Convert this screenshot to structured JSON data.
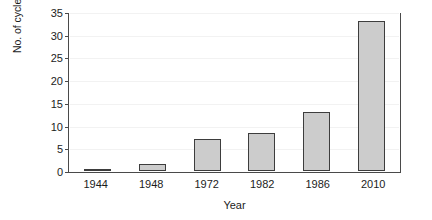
{
  "chart_data": {
    "type": "bar",
    "title": "",
    "subtitle": "",
    "xlabel": "Year",
    "ylabel": "No. of cycle-rickshaws per 1,000 residents",
    "categories": [
      "1944",
      "1948",
      "1972",
      "1982",
      "1986",
      "2010"
    ],
    "values": [
      0.3,
      1.5,
      7.2,
      8.5,
      13.0,
      33.3
    ],
    "series": [
      {
        "name": "No. of cycle-rickshaws per 1,000 residents",
        "values": [
          0.3,
          1.5,
          7.2,
          8.5,
          13.0,
          33.3
        ]
      }
    ],
    "ylim": [
      0,
      35
    ],
    "ytick_labels": [
      "0",
      "5",
      "10",
      "15",
      "20",
      "25",
      "30",
      "35"
    ],
    "ytick_values": [
      0,
      5,
      10,
      15,
      20,
      25,
      30,
      35
    ],
    "grid": true,
    "legend": false,
    "legend_position": "none",
    "bar_fill_color": "#cccccc",
    "bar_border_color": "#3d3d3d",
    "axis_color": "#4a4a4a",
    "grid_color": "#f2f2f2",
    "background_color": "#ffffff",
    "text_color": "#1c1c1c"
  }
}
